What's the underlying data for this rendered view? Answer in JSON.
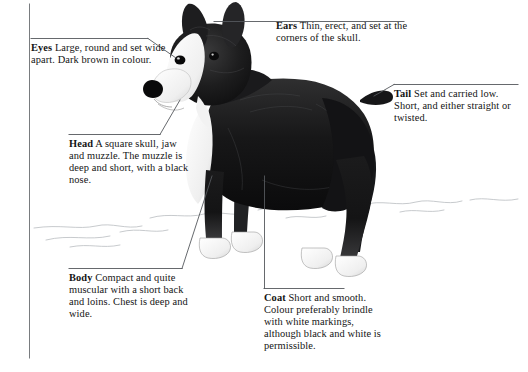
{
  "figure": {
    "orientation": "standing-profile-left-facing",
    "style": "black-and-white-engraving",
    "ink_color": "#141414",
    "paper_color": "#ffffff",
    "rule_color": "#55585c"
  },
  "callouts": [
    {
      "id": "eyes",
      "keyword": "Eyes",
      "text": "Large, round and set wide apart. Dark brown in colour.",
      "full": "Eyes Large, round and set wide apart. Dark brown in colour.",
      "lines": [
        "Eyes Large, round",
        "and set wide apart.",
        "Dark brown in colour."
      ],
      "points_to": "eye",
      "leader": "rule-then-diagonal-right-down"
    },
    {
      "id": "head",
      "keyword": "Head",
      "text": "A square skull, jaw and muzzle. The muzzle is deep and short, with a black nose.",
      "full": "Head A square skull, jaw and muzzle. The muzzle is deep and short, with a black nose.",
      "lines": [
        "Head A square skull,",
        "jaw and muzzle. The",
        "muzzle is deep and",
        "short, with a black",
        "nose."
      ],
      "points_to": "muzzle",
      "leader": "rule-then-diagonal-right-up"
    },
    {
      "id": "body",
      "keyword": "Body",
      "text": "Compact and quite muscular with a short back and loins. Chest is deep and wide.",
      "full": "Body Compact and quite muscular with a short back and loins. Chest is deep and wide.",
      "lines": [
        "Body Compact and",
        "quite muscular with a",
        "short back and loins.",
        "Chest is deep and",
        "wide."
      ],
      "points_to": "chest",
      "leader": "rule-then-diagonal-right-up"
    },
    {
      "id": "ears",
      "keyword": "Ears",
      "text": "Thin, erect, and set at the corners of the skull.",
      "full": "Ears Thin, erect, and set at the corners of the skull.",
      "lines": [
        "Ears Thin, erect, and",
        "set at the corners of",
        "the skull."
      ],
      "points_to": "ear",
      "leader": "horizontal-rule-left"
    },
    {
      "id": "tail",
      "keyword": "Tail",
      "text": "Set and carried low. Short, and either straight or twisted.",
      "full": "Tail Set and carried low. Short, and either straight or twisted.",
      "lines": [
        "Tail Set and carried",
        "low. Short, and either",
        "straight or twisted."
      ],
      "points_to": "tail",
      "leader": "rule-then-diagonal-left-down"
    },
    {
      "id": "coat",
      "keyword": "Coat",
      "text": "Short and smooth. Colour preferably brindle with white markings, although black and white is permissible.",
      "full": "Coat Short and smooth. Colour preferably brindle with white markings, although black and white is permissible.",
      "lines": [
        "Coat Short and",
        "smooth. Colour",
        "preferably brindle",
        "with white markings,",
        "although black and",
        "white is permissible."
      ],
      "points_to": "flank",
      "leader": "elbow-up-left"
    }
  ]
}
